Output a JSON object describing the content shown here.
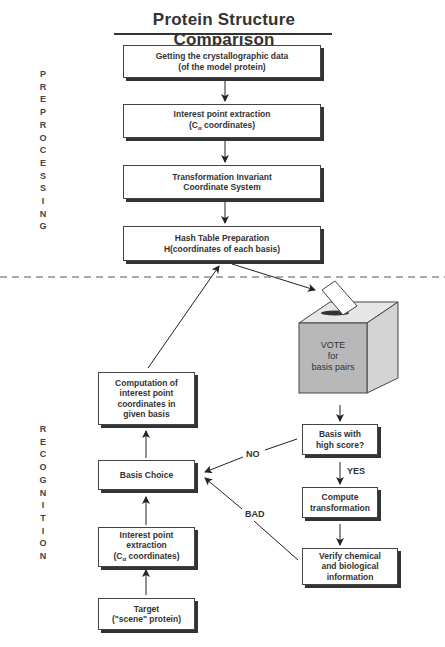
{
  "title": "Protein Structure Comparison",
  "phases": {
    "preprocessing": "P\nR\nE\nP\nR\nO\nC\nE\nS\nS\nI\nN\nG",
    "recognition": "R\nE\nC\nO\nG\nN\nI\nT\nI\nO\nN"
  },
  "preprocessing_steps": [
    {
      "label": "Getting the crystallographic data\n(of the model protein)"
    },
    {
      "label_line1": "Interest point extraction",
      "label_prefix": "(C",
      "label_sub": "α",
      "label_suffix": " coordinates)"
    },
    {
      "label": "Transformation Invariant\nCoordinate System"
    },
    {
      "label": "Hash Table Preparation\nH(coordinates of each basis)"
    }
  ],
  "recognition_left": [
    {
      "label": "Computation of\ninterest point\ncoordinates in\ngiven basis"
    },
    {
      "label": "Basis Choice"
    },
    {
      "label_line1": "Interest point\nextraction",
      "label_prefix": "(C",
      "label_sub": "α",
      "label_suffix": " coordinates)"
    },
    {
      "label": "Target\n(\"scene\" protein)"
    }
  ],
  "vote_box": {
    "label": "VOTE\nfor\nbasis pairs"
  },
  "recognition_right": [
    {
      "label": "Basis with\nhigh score?"
    },
    {
      "label": "Compute\ntransformation"
    },
    {
      "label": "Verify chemical\nand biological\ninformation"
    }
  ],
  "edge_labels": {
    "yes": "YES",
    "no": "NO",
    "bad": "BAD"
  },
  "colors": {
    "box_border": "#444444",
    "box_shadow": "#333333",
    "ballot_front": "#b8b8b8",
    "ballot_side": "#d4d4d4",
    "ballot_top": "#e6e6e6"
  }
}
